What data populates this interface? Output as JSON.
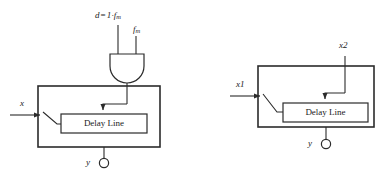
{
  "figure": {
    "kind": "block-diagram",
    "background_color": "#ffffff",
    "line_color": "#2b2b2b",
    "text_color": "#1a1a1a",
    "panel_count": 2
  },
  "left_panel": {
    "name": "and-gated-delay-line",
    "gate": {
      "type": "and-gate",
      "input_labels": [
        "d = 1·f_m",
        "f_m"
      ],
      "input_top_label": "d = 1·f",
      "input_top_label_sub": "m",
      "input_top_label_op": "=",
      "input_top_label_lead": "d",
      "input_top_label_value": "1·f",
      "input_side_label": "f",
      "input_side_label_sub": "m"
    },
    "outer_block": {
      "label": ""
    },
    "inner_block": {
      "label": "Delay Line"
    },
    "signals": {
      "input_label": "x",
      "output_label": "y"
    },
    "output_terminal": {
      "shape": "open-circle"
    }
  },
  "right_panel": {
    "name": "two-input-delay-line",
    "outer_block": {
      "label": ""
    },
    "inner_block": {
      "label": "Delay Line"
    },
    "signals": {
      "input_label": "x1",
      "control_label": "x2",
      "output_label": "y"
    },
    "output_terminal": {
      "shape": "open-circle"
    }
  }
}
